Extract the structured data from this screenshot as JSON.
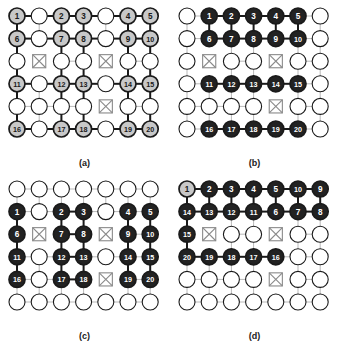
{
  "figure": {
    "title": "",
    "panel_count": 4,
    "grid": {
      "cols": 7,
      "rows": 6
    },
    "colors": {
      "background": "#ffffff",
      "edge_weak": "#b9b9b9",
      "edge_strong": "#1a1a1a",
      "node_outline": "#1a1a1a",
      "node_empty_fill": "#ffffff",
      "node_gray_fill": "#c8c8c8",
      "node_black_fill": "#222222",
      "node_black_text": "#ffffff",
      "node_gray_text": "#1a1a1a",
      "obstacle_stroke": "#8a8a8a",
      "caption_color": "#1a1a1a"
    }
  },
  "panels": [
    {
      "id": "a",
      "caption": "(a)",
      "node_style": "gray",
      "obstacles": [
        [
          2,
          1
        ],
        [
          2,
          4
        ],
        [
          4,
          4
        ]
      ],
      "labels": [
        {
          "r": 0,
          "c": 0,
          "t": "1"
        },
        {
          "r": 0,
          "c": 2,
          "t": "2"
        },
        {
          "r": 0,
          "c": 3,
          "t": "3"
        },
        {
          "r": 0,
          "c": 5,
          "t": "4"
        },
        {
          "r": 0,
          "c": 6,
          "t": "5"
        },
        {
          "r": 1,
          "c": 0,
          "t": "6"
        },
        {
          "r": 1,
          "c": 2,
          "t": "7"
        },
        {
          "r": 1,
          "c": 3,
          "t": "8"
        },
        {
          "r": 1,
          "c": 5,
          "t": "9"
        },
        {
          "r": 1,
          "c": 6,
          "t": "10"
        },
        {
          "r": 3,
          "c": 0,
          "t": "11"
        },
        {
          "r": 3,
          "c": 2,
          "t": "12"
        },
        {
          "r": 3,
          "c": 3,
          "t": "13"
        },
        {
          "r": 3,
          "c": 5,
          "t": "14"
        },
        {
          "r": 3,
          "c": 6,
          "t": "15"
        },
        {
          "r": 5,
          "c": 0,
          "t": "16"
        },
        {
          "r": 5,
          "c": 2,
          "t": "17"
        },
        {
          "r": 5,
          "c": 3,
          "t": "18"
        },
        {
          "r": 5,
          "c": 5,
          "t": "19"
        },
        {
          "r": 5,
          "c": 6,
          "t": "20"
        }
      ],
      "strong_h": [
        [
          0,
          0
        ],
        [
          0,
          1
        ],
        [
          0,
          2
        ],
        [
          0,
          3
        ],
        [
          0,
          4
        ],
        [
          0,
          5
        ],
        [
          1,
          0
        ],
        [
          1,
          1
        ],
        [
          1,
          2
        ],
        [
          1,
          3
        ],
        [
          1,
          4
        ],
        [
          1,
          5
        ],
        [
          3,
          0
        ],
        [
          3,
          1
        ],
        [
          3,
          2
        ],
        [
          3,
          3
        ],
        [
          3,
          4
        ],
        [
          3,
          5
        ],
        [
          5,
          0
        ],
        [
          5,
          1
        ],
        [
          5,
          2
        ],
        [
          5,
          3
        ],
        [
          5,
          4
        ],
        [
          5,
          5
        ]
      ],
      "strong_v": [
        [
          0,
          0
        ],
        [
          1,
          0
        ],
        [
          2,
          0
        ],
        [
          3,
          0
        ],
        [
          4,
          0
        ],
        [
          0,
          2
        ],
        [
          1,
          2
        ],
        [
          2,
          2
        ],
        [
          3,
          2
        ],
        [
          4,
          2
        ],
        [
          0,
          3
        ],
        [
          1,
          3
        ],
        [
          2,
          3
        ],
        [
          3,
          3
        ],
        [
          4,
          3
        ],
        [
          0,
          5
        ],
        [
          1,
          5
        ],
        [
          2,
          5
        ],
        [
          3,
          5
        ],
        [
          4,
          5
        ],
        [
          0,
          6
        ],
        [
          1,
          6
        ],
        [
          2,
          6
        ],
        [
          3,
          6
        ],
        [
          4,
          6
        ]
      ]
    },
    {
      "id": "b",
      "caption": "(b)",
      "node_style": "black",
      "obstacles": [
        [
          2,
          1
        ],
        [
          2,
          4
        ],
        [
          4,
          4
        ]
      ],
      "labels": [
        {
          "r": 0,
          "c": 1,
          "t": "1"
        },
        {
          "r": 0,
          "c": 2,
          "t": "2"
        },
        {
          "r": 0,
          "c": 3,
          "t": "3"
        },
        {
          "r": 0,
          "c": 4,
          "t": "4"
        },
        {
          "r": 0,
          "c": 5,
          "t": "5"
        },
        {
          "r": 1,
          "c": 1,
          "t": "6"
        },
        {
          "r": 1,
          "c": 2,
          "t": "7"
        },
        {
          "r": 1,
          "c": 3,
          "t": "8"
        },
        {
          "r": 1,
          "c": 4,
          "t": "9"
        },
        {
          "r": 1,
          "c": 5,
          "t": "10"
        },
        {
          "r": 3,
          "c": 1,
          "t": "11"
        },
        {
          "r": 3,
          "c": 2,
          "t": "12"
        },
        {
          "r": 3,
          "c": 3,
          "t": "13"
        },
        {
          "r": 3,
          "c": 4,
          "t": "14"
        },
        {
          "r": 3,
          "c": 5,
          "t": "15"
        },
        {
          "r": 5,
          "c": 1,
          "t": "16"
        },
        {
          "r": 5,
          "c": 2,
          "t": "17"
        },
        {
          "r": 5,
          "c": 3,
          "t": "18"
        },
        {
          "r": 5,
          "c": 4,
          "t": "19"
        },
        {
          "r": 5,
          "c": 5,
          "t": "20"
        }
      ],
      "strong_h": [
        [
          0,
          1
        ],
        [
          0,
          2
        ],
        [
          0,
          3
        ],
        [
          0,
          4
        ],
        [
          1,
          1
        ],
        [
          1,
          2
        ],
        [
          1,
          3
        ],
        [
          1,
          4
        ],
        [
          3,
          1
        ],
        [
          3,
          2
        ],
        [
          3,
          3
        ],
        [
          3,
          4
        ],
        [
          5,
          1
        ],
        [
          5,
          2
        ],
        [
          5,
          3
        ],
        [
          5,
          4
        ]
      ],
      "strong_v": [
        [
          0,
          1
        ],
        [
          0,
          2
        ],
        [
          0,
          3
        ],
        [
          0,
          4
        ],
        [
          0,
          5
        ]
      ]
    },
    {
      "id": "c",
      "caption": "(c)",
      "node_style": "black",
      "obstacles": [
        [
          2,
          1
        ],
        [
          2,
          4
        ],
        [
          4,
          4
        ]
      ],
      "labels": [
        {
          "r": 1,
          "c": 0,
          "t": "1"
        },
        {
          "r": 1,
          "c": 2,
          "t": "2"
        },
        {
          "r": 1,
          "c": 3,
          "t": "3"
        },
        {
          "r": 1,
          "c": 5,
          "t": "4"
        },
        {
          "r": 1,
          "c": 6,
          "t": "5"
        },
        {
          "r": 2,
          "c": 0,
          "t": "6"
        },
        {
          "r": 2,
          "c": 2,
          "t": "7"
        },
        {
          "r": 2,
          "c": 3,
          "t": "8"
        },
        {
          "r": 2,
          "c": 5,
          "t": "9"
        },
        {
          "r": 2,
          "c": 6,
          "t": "10"
        },
        {
          "r": 3,
          "c": 0,
          "t": "11"
        },
        {
          "r": 3,
          "c": 2,
          "t": "12"
        },
        {
          "r": 3,
          "c": 3,
          "t": "13"
        },
        {
          "r": 3,
          "c": 5,
          "t": "14"
        },
        {
          "r": 3,
          "c": 6,
          "t": "15"
        },
        {
          "r": 4,
          "c": 0,
          "t": "16"
        },
        {
          "r": 4,
          "c": 2,
          "t": "17"
        },
        {
          "r": 4,
          "c": 3,
          "t": "18"
        },
        {
          "r": 4,
          "c": 5,
          "t": "19"
        },
        {
          "r": 4,
          "c": 6,
          "t": "20"
        }
      ],
      "strong_h": [
        [
          1,
          2
        ],
        [
          2,
          2
        ],
        [
          3,
          2
        ],
        [
          4,
          2
        ]
      ],
      "strong_v": [
        [
          1,
          0
        ],
        [
          2,
          0
        ],
        [
          3,
          0
        ],
        [
          1,
          2
        ],
        [
          2,
          2
        ],
        [
          3,
          2
        ],
        [
          1,
          3
        ],
        [
          2,
          3
        ],
        [
          3,
          3
        ],
        [
          1,
          5
        ],
        [
          2,
          5
        ],
        [
          3,
          5
        ],
        [
          1,
          6
        ],
        [
          2,
          6
        ],
        [
          3,
          6
        ]
      ]
    },
    {
      "id": "d",
      "caption": "(d)",
      "node_style": "black",
      "first_node_gray": true,
      "obstacles": [
        [
          2,
          1
        ],
        [
          2,
          4
        ],
        [
          4,
          4
        ]
      ],
      "labels": [
        {
          "r": 0,
          "c": 0,
          "t": "1"
        },
        {
          "r": 0,
          "c": 1,
          "t": "2"
        },
        {
          "r": 0,
          "c": 2,
          "t": "3"
        },
        {
          "r": 0,
          "c": 3,
          "t": "4"
        },
        {
          "r": 0,
          "c": 4,
          "t": "5"
        },
        {
          "r": 0,
          "c": 5,
          "t": "10"
        },
        {
          "r": 0,
          "c": 6,
          "t": "9"
        },
        {
          "r": 1,
          "c": 0,
          "t": "14"
        },
        {
          "r": 1,
          "c": 1,
          "t": "13"
        },
        {
          "r": 1,
          "c": 2,
          "t": "12"
        },
        {
          "r": 1,
          "c": 3,
          "t": "11"
        },
        {
          "r": 1,
          "c": 4,
          "t": "6"
        },
        {
          "r": 1,
          "c": 5,
          "t": "7"
        },
        {
          "r": 1,
          "c": 6,
          "t": "8"
        },
        {
          "r": 2,
          "c": 0,
          "t": "15"
        },
        {
          "r": 3,
          "c": 0,
          "t": "20"
        },
        {
          "r": 3,
          "c": 1,
          "t": "19"
        },
        {
          "r": 3,
          "c": 2,
          "t": "18"
        },
        {
          "r": 3,
          "c": 3,
          "t": "17"
        },
        {
          "r": 3,
          "c": 4,
          "t": "16"
        }
      ],
      "strong_h": [
        [
          0,
          0
        ],
        [
          0,
          1
        ],
        [
          0,
          2
        ],
        [
          0,
          3
        ],
        [
          0,
          4
        ],
        [
          0,
          5
        ],
        [
          1,
          0
        ],
        [
          1,
          1
        ],
        [
          1,
          2
        ],
        [
          1,
          3
        ],
        [
          1,
          4
        ],
        [
          1,
          5
        ],
        [
          3,
          0
        ],
        [
          3,
          1
        ],
        [
          3,
          2
        ],
        [
          3,
          3
        ]
      ],
      "strong_v": [
        [
          0,
          0
        ],
        [
          1,
          0
        ],
        [
          2,
          0
        ],
        [
          0,
          3
        ],
        [
          0,
          4
        ],
        [
          0,
          5
        ],
        [
          0,
          6
        ],
        [
          0,
          1
        ],
        [
          0,
          2
        ]
      ]
    }
  ]
}
